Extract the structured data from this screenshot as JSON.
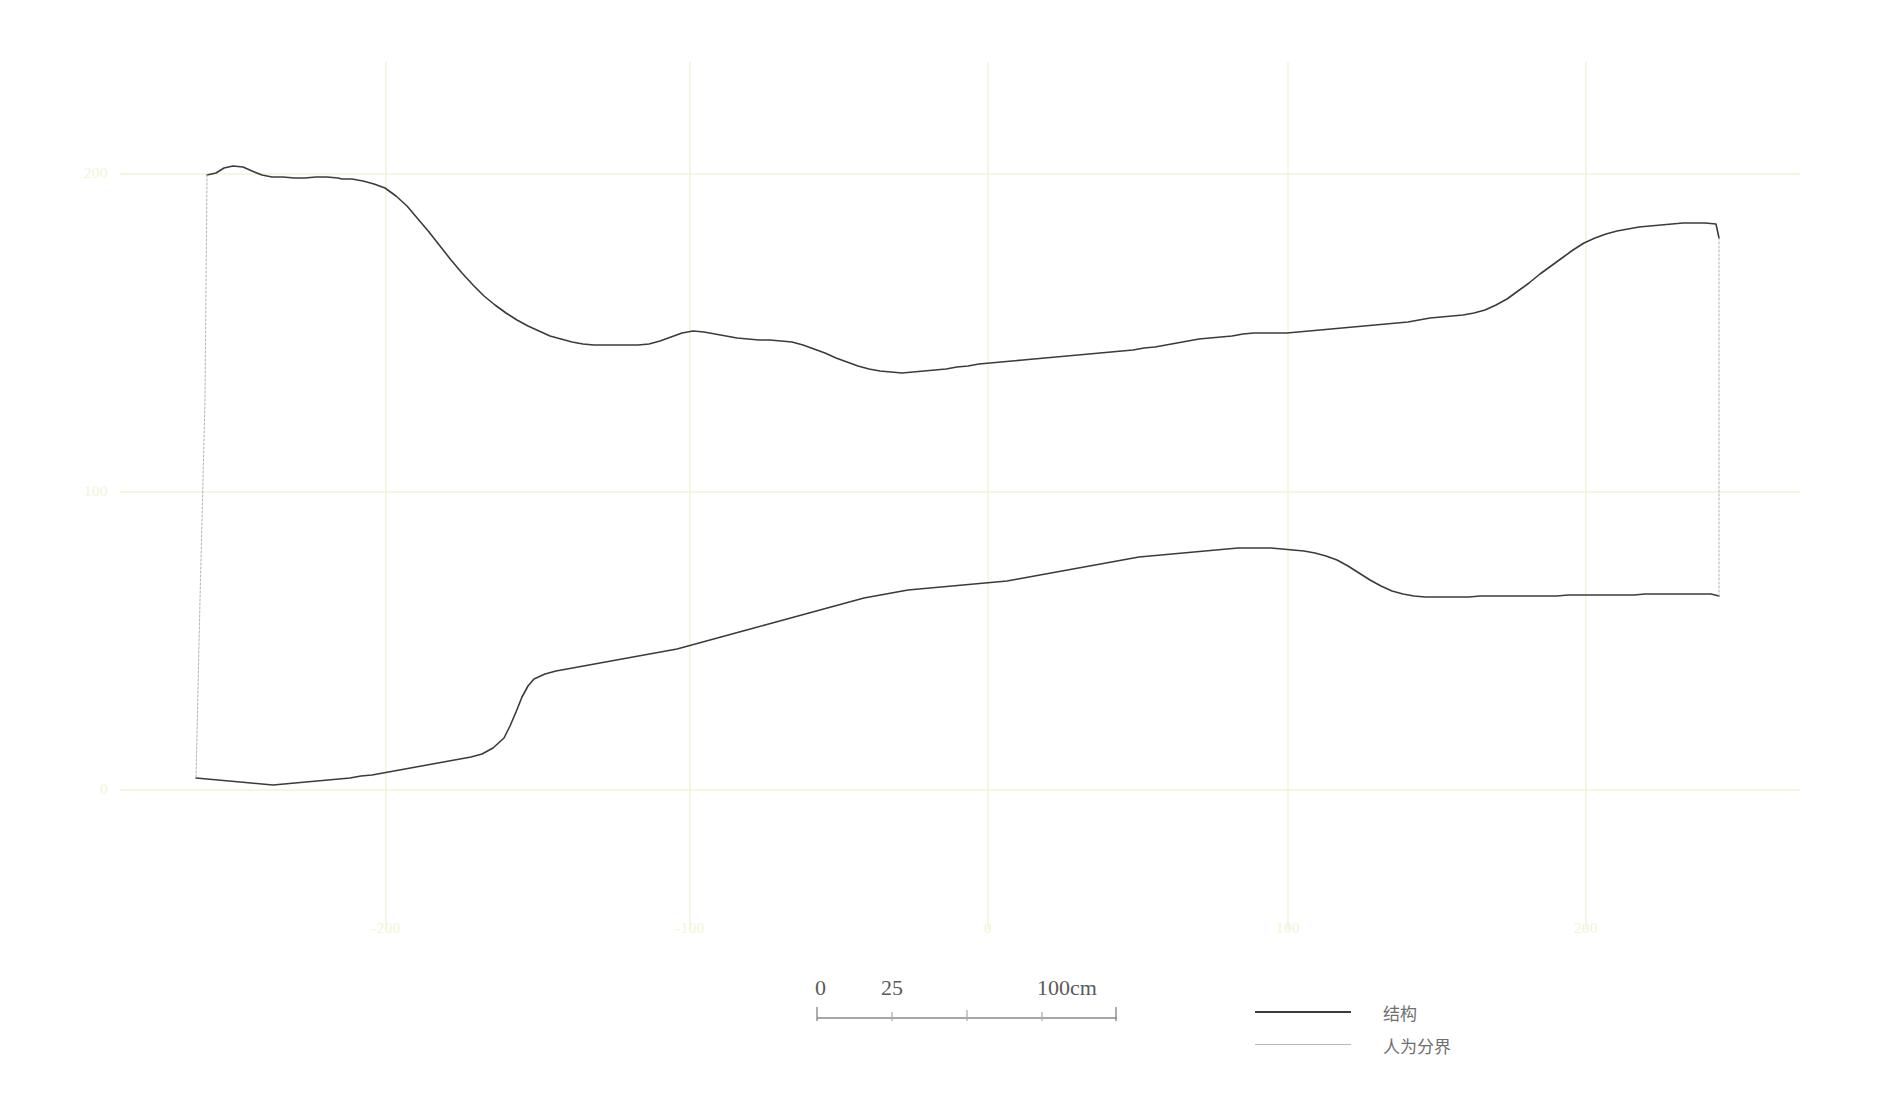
{
  "figure": {
    "type": "profile-section-drawing",
    "background_color": "#ffffff",
    "structure_line_color": "#3b3b3b",
    "boundary_line_color": "#b9b9b9",
    "grid_color": "#f2f2d8",
    "axis_label_color": "#f3f3d2"
  },
  "axes": {
    "y_ticks": [
      {
        "label": "200",
        "value": 200,
        "px_y": 174
      },
      {
        "label": "100",
        "value": 100,
        "px_y": 492
      },
      {
        "label": "0",
        "value": 0,
        "px_y": 790
      }
    ],
    "x_ticks": [
      {
        "label": "-200",
        "value": -200,
        "px_x": 386
      },
      {
        "label": "-100",
        "value": -100,
        "px_x": 690
      },
      {
        "label": "0",
        "value": 0,
        "px_x": 988
      },
      {
        "label": "100",
        "value": 100,
        "px_x": 1288
      },
      {
        "label": "200",
        "value": 200,
        "px_x": 1586
      }
    ],
    "grid_shown": true
  },
  "scalebar": {
    "label_0": "0",
    "label_25": "25",
    "label_100": "100cm",
    "ticks": [
      0,
      25,
      50,
      75,
      100
    ]
  },
  "legend": {
    "position": "bottom-right",
    "items": [
      {
        "label": "结构",
        "style": "solid-dark"
      },
      {
        "label": "人为分界",
        "style": "solid-light"
      }
    ]
  },
  "chart_data": {
    "type": "line",
    "title": "",
    "xlabel": "",
    "ylabel": "",
    "xlim": [
      -260,
      260
    ],
    "ylim": [
      -40,
      240
    ],
    "grid": true,
    "legend_position": "bottom-right",
    "series": [
      {
        "name": "结构 - 上界面",
        "style": "solid-dark",
        "points_px": [
          [
            207,
            175
          ],
          [
            216,
            173
          ],
          [
            224,
            168
          ],
          [
            233,
            166
          ],
          [
            243,
            167
          ],
          [
            252,
            171
          ],
          [
            262,
            175
          ],
          [
            272,
            177
          ],
          [
            283,
            177
          ],
          [
            294,
            178
          ],
          [
            305,
            178
          ],
          [
            316,
            177
          ],
          [
            327,
            177
          ],
          [
            338,
            178
          ],
          [
            342,
            179
          ],
          [
            352,
            179
          ],
          [
            363,
            181
          ],
          [
            374,
            184
          ],
          [
            385,
            188
          ],
          [
            396,
            196
          ],
          [
            407,
            206
          ],
          [
            418,
            219
          ],
          [
            429,
            232
          ],
          [
            440,
            246
          ],
          [
            451,
            260
          ],
          [
            462,
            273
          ],
          [
            473,
            285
          ],
          [
            484,
            296
          ],
          [
            495,
            305
          ],
          [
            506,
            313
          ],
          [
            517,
            320
          ],
          [
            528,
            326
          ],
          [
            539,
            331
          ],
          [
            550,
            336
          ],
          [
            561,
            339
          ],
          [
            572,
            342
          ],
          [
            583,
            344
          ],
          [
            594,
            345
          ],
          [
            605,
            345
          ],
          [
            616,
            345
          ],
          [
            627,
            345
          ],
          [
            638,
            345
          ],
          [
            649,
            344
          ],
          [
            660,
            341
          ],
          [
            671,
            337
          ],
          [
            682,
            333
          ],
          [
            693,
            331
          ],
          [
            704,
            332
          ],
          [
            715,
            334
          ],
          [
            726,
            336
          ],
          [
            737,
            338
          ],
          [
            748,
            339
          ],
          [
            759,
            340
          ],
          [
            770,
            340
          ],
          [
            781,
            341
          ],
          [
            792,
            342
          ],
          [
            803,
            345
          ],
          [
            814,
            349
          ],
          [
            825,
            353
          ],
          [
            836,
            358
          ],
          [
            847,
            362
          ],
          [
            858,
            366
          ],
          [
            869,
            369
          ],
          [
            880,
            371
          ],
          [
            891,
            372
          ],
          [
            902,
            373
          ],
          [
            913,
            372
          ],
          [
            924,
            371
          ],
          [
            935,
            370
          ],
          [
            946,
            369
          ],
          [
            957,
            367
          ],
          [
            968,
            366
          ],
          [
            979,
            364
          ],
          [
            990,
            363
          ],
          [
            1001,
            362
          ],
          [
            1012,
            361
          ],
          [
            1023,
            360
          ],
          [
            1034,
            359
          ],
          [
            1045,
            358
          ],
          [
            1056,
            357
          ],
          [
            1067,
            356
          ],
          [
            1078,
            355
          ],
          [
            1089,
            354
          ],
          [
            1100,
            353
          ],
          [
            1111,
            352
          ],
          [
            1122,
            351
          ],
          [
            1133,
            350
          ],
          [
            1144,
            348
          ],
          [
            1155,
            347
          ],
          [
            1166,
            345
          ],
          [
            1177,
            343
          ],
          [
            1188,
            341
          ],
          [
            1199,
            339
          ],
          [
            1210,
            338
          ],
          [
            1221,
            337
          ],
          [
            1232,
            336
          ],
          [
            1243,
            334
          ],
          [
            1254,
            333
          ],
          [
            1265,
            333
          ],
          [
            1276,
            333
          ],
          [
            1287,
            333
          ],
          [
            1298,
            332
          ],
          [
            1309,
            331
          ],
          [
            1320,
            330
          ],
          [
            1331,
            329
          ],
          [
            1342,
            328
          ],
          [
            1353,
            327
          ],
          [
            1364,
            326
          ],
          [
            1375,
            325
          ],
          [
            1386,
            324
          ],
          [
            1397,
            323
          ],
          [
            1408,
            322
          ],
          [
            1419,
            320
          ],
          [
            1430,
            318
          ],
          [
            1441,
            317
          ],
          [
            1452,
            316
          ],
          [
            1463,
            315
          ],
          [
            1474,
            313
          ],
          [
            1485,
            310
          ],
          [
            1496,
            305
          ],
          [
            1507,
            299
          ],
          [
            1518,
            291
          ],
          [
            1529,
            283
          ],
          [
            1540,
            274
          ],
          [
            1551,
            266
          ],
          [
            1562,
            258
          ],
          [
            1573,
            250
          ],
          [
            1584,
            243
          ],
          [
            1595,
            238
          ],
          [
            1606,
            234
          ],
          [
            1617,
            231
          ],
          [
            1628,
            229
          ],
          [
            1639,
            227
          ],
          [
            1650,
            226
          ],
          [
            1661,
            225
          ],
          [
            1672,
            224
          ],
          [
            1683,
            223
          ],
          [
            1694,
            223
          ],
          [
            1705,
            223
          ],
          [
            1716,
            224
          ],
          [
            1719,
            238
          ]
        ]
      },
      {
        "name": "结构 - 下界面",
        "style": "solid-dark",
        "points_px": [
          [
            196,
            778
          ],
          [
            207,
            779
          ],
          [
            218,
            780
          ],
          [
            229,
            781
          ],
          [
            240,
            782
          ],
          [
            251,
            783
          ],
          [
            262,
            784
          ],
          [
            273,
            785
          ],
          [
            284,
            784
          ],
          [
            295,
            783
          ],
          [
            306,
            782
          ],
          [
            317,
            781
          ],
          [
            328,
            780
          ],
          [
            339,
            779
          ],
          [
            350,
            778
          ],
          [
            361,
            776
          ],
          [
            372,
            775
          ],
          [
            383,
            773
          ],
          [
            394,
            771
          ],
          [
            405,
            769
          ],
          [
            416,
            767
          ],
          [
            427,
            765
          ],
          [
            438,
            763
          ],
          [
            449,
            761
          ],
          [
            460,
            759
          ],
          [
            471,
            757
          ],
          [
            482,
            754
          ],
          [
            493,
            748
          ],
          [
            504,
            738
          ],
          [
            510,
            726
          ],
          [
            516,
            712
          ],
          [
            522,
            697
          ],
          [
            528,
            686
          ],
          [
            534,
            679
          ],
          [
            545,
            674
          ],
          [
            556,
            671
          ],
          [
            567,
            669
          ],
          [
            578,
            667
          ],
          [
            589,
            665
          ],
          [
            600,
            663
          ],
          [
            611,
            661
          ],
          [
            622,
            659
          ],
          [
            633,
            657
          ],
          [
            644,
            655
          ],
          [
            655,
            653
          ],
          [
            666,
            651
          ],
          [
            677,
            649
          ],
          [
            688,
            646
          ],
          [
            699,
            643
          ],
          [
            710,
            640
          ],
          [
            721,
            637
          ],
          [
            732,
            634
          ],
          [
            743,
            631
          ],
          [
            754,
            628
          ],
          [
            765,
            625
          ],
          [
            776,
            622
          ],
          [
            787,
            619
          ],
          [
            798,
            616
          ],
          [
            809,
            613
          ],
          [
            820,
            610
          ],
          [
            831,
            607
          ],
          [
            842,
            604
          ],
          [
            853,
            601
          ],
          [
            864,
            598
          ],
          [
            875,
            596
          ],
          [
            886,
            594
          ],
          [
            897,
            592
          ],
          [
            908,
            590
          ],
          [
            919,
            589
          ],
          [
            930,
            588
          ],
          [
            941,
            587
          ],
          [
            952,
            586
          ],
          [
            963,
            585
          ],
          [
            974,
            584
          ],
          [
            985,
            583
          ],
          [
            996,
            582
          ],
          [
            1007,
            581
          ],
          [
            1018,
            579
          ],
          [
            1029,
            577
          ],
          [
            1040,
            575
          ],
          [
            1051,
            573
          ],
          [
            1062,
            571
          ],
          [
            1073,
            569
          ],
          [
            1084,
            567
          ],
          [
            1095,
            565
          ],
          [
            1106,
            563
          ],
          [
            1117,
            561
          ],
          [
            1128,
            559
          ],
          [
            1139,
            557
          ],
          [
            1150,
            556
          ],
          [
            1161,
            555
          ],
          [
            1172,
            554
          ],
          [
            1183,
            553
          ],
          [
            1194,
            552
          ],
          [
            1205,
            551
          ],
          [
            1216,
            550
          ],
          [
            1227,
            549
          ],
          [
            1238,
            548
          ],
          [
            1249,
            548
          ],
          [
            1260,
            548
          ],
          [
            1271,
            548
          ],
          [
            1282,
            549
          ],
          [
            1293,
            550
          ],
          [
            1304,
            551
          ],
          [
            1315,
            553
          ],
          [
            1326,
            556
          ],
          [
            1337,
            560
          ],
          [
            1348,
            566
          ],
          [
            1359,
            573
          ],
          [
            1370,
            580
          ],
          [
            1381,
            586
          ],
          [
            1392,
            591
          ],
          [
            1403,
            594
          ],
          [
            1414,
            596
          ],
          [
            1425,
            597
          ],
          [
            1436,
            597
          ],
          [
            1447,
            597
          ],
          [
            1458,
            597
          ],
          [
            1469,
            597
          ],
          [
            1480,
            596
          ],
          [
            1491,
            596
          ],
          [
            1502,
            596
          ],
          [
            1513,
            596
          ],
          [
            1524,
            596
          ],
          [
            1535,
            596
          ],
          [
            1546,
            596
          ],
          [
            1557,
            596
          ],
          [
            1568,
            595
          ],
          [
            1579,
            595
          ],
          [
            1590,
            595
          ],
          [
            1601,
            595
          ],
          [
            1612,
            595
          ],
          [
            1623,
            595
          ],
          [
            1634,
            595
          ],
          [
            1645,
            594
          ],
          [
            1656,
            594
          ],
          [
            1667,
            594
          ],
          [
            1678,
            594
          ],
          [
            1689,
            594
          ],
          [
            1700,
            594
          ],
          [
            1711,
            594
          ],
          [
            1719,
            596
          ]
        ]
      },
      {
        "name": "人为分界 - 左边界",
        "style": "solid-light",
        "points_px": [
          [
            207,
            175
          ],
          [
            205,
            400
          ],
          [
            200,
            600
          ],
          [
            196,
            778
          ]
        ]
      },
      {
        "name": "人为分界 - 右边界",
        "style": "solid-light",
        "points_px": [
          [
            1719,
            238
          ],
          [
            1719,
            420
          ],
          [
            1719,
            520
          ],
          [
            1719,
            596
          ]
        ]
      }
    ]
  }
}
